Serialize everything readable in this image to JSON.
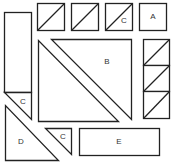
{
  "figure": {
    "labels": {
      "square_a": "A",
      "triangle_b": "B",
      "triangle_c_top": "C",
      "triangle_c_left": "C",
      "triangle_c_bottom": "C",
      "triangle_d": "D",
      "rectangle_e": "E"
    },
    "colors": {
      "stroke": "#222222",
      "fill": "#ffffff"
    }
  }
}
